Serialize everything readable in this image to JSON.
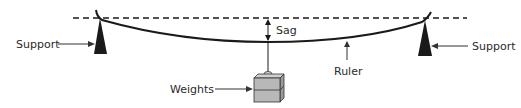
{
  "diagram": {
    "labels": {
      "support_left": "Support",
      "support_right": "Support",
      "sag": "Sag",
      "ruler": "Ruler",
      "weights": "Weights"
    },
    "colors": {
      "line": "#1a1a1a",
      "box_fill": "#b8b8b8",
      "box_side": "#9a9a9a",
      "box_top": "#d0d0d0",
      "text": "#2a2a2a"
    }
  }
}
